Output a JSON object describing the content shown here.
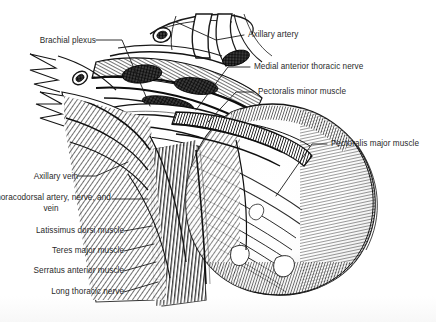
{
  "figure": {
    "background_color": "#ffffff",
    "ink_color": "#1a1a1a",
    "label_color": "#2a2a2a"
  },
  "labels": {
    "left": [
      {
        "id": "brachial-plexus",
        "text": "Brachial plexus",
        "x": 22,
        "y": 36
      },
      {
        "id": "axillary-vein",
        "text": "Axillary vein",
        "x": 18,
        "y": 172
      },
      {
        "id": "thoracodorsal",
        "text": "Thoracodorsal artery, nerve, and vein",
        "x": 8,
        "y": 198
      },
      {
        "id": "latissimus-dorsi",
        "text": "Latissimus dorsi muscle",
        "x": 5,
        "y": 228
      },
      {
        "id": "teres-major",
        "text": "Teres major muscle",
        "x": 27,
        "y": 248
      },
      {
        "id": "serratus-anterior",
        "text": "Serratus anterior muscle",
        "x": 10,
        "y": 268
      },
      {
        "id": "long-thoracic",
        "text": "Long thoracic nerve",
        "x": 30,
        "y": 289
      }
    ],
    "right": [
      {
        "id": "axillary-artery",
        "text": "Axillary artery",
        "x": 248,
        "y": 32
      },
      {
        "id": "medial-ant-thoracic",
        "text": "Medial anterior thoracic nerve",
        "x": 254,
        "y": 64
      },
      {
        "id": "pectoralis-minor",
        "text": "Pectoralis minor muscle",
        "x": 258,
        "y": 89
      },
      {
        "id": "pectoralis-major",
        "text": "Pectoralis major muscle",
        "x": 331,
        "y": 141
      }
    ]
  }
}
